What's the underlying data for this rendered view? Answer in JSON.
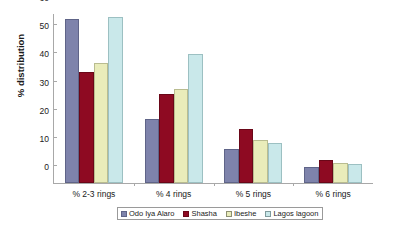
{
  "chart_data": {
    "type": "bar",
    "title": "",
    "subtitle": "",
    "xlabel": "",
    "ylabel": "% distribution",
    "ylim": [
      0,
      60
    ],
    "yticks": [
      0,
      10,
      20,
      30,
      40,
      50,
      60
    ],
    "ytick_labels": [
      "0",
      "10",
      "20",
      "30",
      "40",
      "50",
      "60"
    ],
    "grid": false,
    "legend_position": "bottom",
    "categories": [
      "% 2-3 rings",
      "% 4 rings",
      "% 5 rings",
      "% 6 rings"
    ],
    "series": [
      {
        "name": "Odo Iya Alaro",
        "color": "#7e83ab",
        "values": [
          58.2,
          22.9,
          12.0,
          5.7
        ]
      },
      {
        "name": "Shasha",
        "color": "#8e0a22",
        "values": [
          39.4,
          31.5,
          19.2,
          8.2
        ]
      },
      {
        "name": "Ibeshe",
        "color": "#e9ecba",
        "values": [
          42.6,
          33.3,
          15.3,
          7.1
        ]
      },
      {
        "name": "Lagos lagoon",
        "color": "#c9e8ea",
        "values": [
          58.9,
          45.7,
          14.2,
          6.9
        ]
      }
    ],
    "annotations": []
  },
  "axis": {
    "line_color": "#a8a8a8",
    "background": "#ffffff"
  }
}
